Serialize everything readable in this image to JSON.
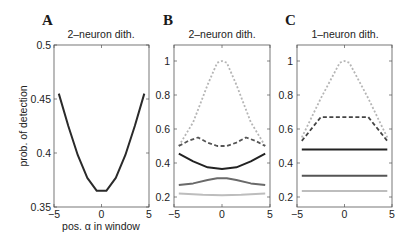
{
  "figure": {
    "panels": [
      {
        "letter": "A",
        "title": "2–neuron dith."
      },
      {
        "letter": "B",
        "title": "2–neuron dith."
      },
      {
        "letter": "C",
        "title": "1–neuron dith."
      }
    ],
    "a_ylabel": "prob. of detection",
    "a_xlabel": "pos. α in window",
    "a_yticks": [
      "0.5",
      "0.45",
      "0.4",
      "0.35"
    ],
    "bc_yticks": [
      "1",
      "0.8",
      "0.6",
      "0.4",
      "0.2"
    ],
    "xticks": [
      "−5",
      "0",
      "5"
    ]
  },
  "chart_data": [
    {
      "type": "line",
      "panel": "A",
      "title": "2–neuron dith.",
      "xlabel": "pos. α in window",
      "ylabel": "prob. of detection",
      "xlim": [
        -5,
        5
      ],
      "ylim": [
        0.35,
        0.5
      ],
      "xticks": [
        -5,
        0,
        5
      ],
      "yticks": [
        0.35,
        0.4,
        0.45,
        0.5
      ],
      "grid": false,
      "series": [
        {
          "name": "detection",
          "color": "#2a2a2a",
          "style": "solid",
          "x": [
            -4.5,
            -3.5,
            -2.5,
            -1.5,
            -0.5,
            0.5,
            1.5,
            2.5,
            3.5,
            4.5
          ],
          "y": [
            0.455,
            0.425,
            0.398,
            0.377,
            0.365,
            0.365,
            0.377,
            0.398,
            0.425,
            0.455
          ]
        }
      ]
    },
    {
      "type": "line",
      "panel": "B",
      "title": "2–neuron dith.",
      "xlabel": "",
      "ylabel": "",
      "xlim": [
        -5,
        5
      ],
      "ylim": [
        0.15,
        1.1
      ],
      "xticks": [
        -5,
        0,
        5
      ],
      "yticks": [
        0.2,
        0.4,
        0.6,
        0.8,
        1.0
      ],
      "grid": false,
      "series": [
        {
          "name": "light dotted",
          "color": "#b5b5b5",
          "style": "dotted",
          "x": [
            -4.5,
            -3,
            -1.5,
            -0.5,
            0,
            0.5,
            1.5,
            3,
            4.5
          ],
          "y": [
            0.5,
            0.64,
            0.86,
            0.99,
            1.0,
            0.99,
            0.86,
            0.64,
            0.5
          ]
        },
        {
          "name": "dark dashed",
          "color": "#555555",
          "style": "dashed",
          "x": [
            -4.5,
            -3.5,
            -2.5,
            -1.5,
            -0.5,
            0,
            0.5,
            1.5,
            2.5,
            3.5,
            4.5
          ],
          "y": [
            0.5,
            0.53,
            0.55,
            0.52,
            0.5,
            0.5,
            0.5,
            0.52,
            0.55,
            0.53,
            0.5
          ]
        },
        {
          "name": "black solid",
          "color": "#222222",
          "style": "solid",
          "x": [
            -4.5,
            -3,
            -1.5,
            0,
            1.5,
            3,
            4.5
          ],
          "y": [
            0.455,
            0.41,
            0.375,
            0.365,
            0.375,
            0.41,
            0.455
          ]
        },
        {
          "name": "gray solid",
          "color": "#6a6a6a",
          "style": "solid",
          "x": [
            -4.5,
            -3,
            -1.5,
            -0.5,
            0,
            0.5,
            1.5,
            3,
            4.5
          ],
          "y": [
            0.27,
            0.28,
            0.3,
            0.31,
            0.31,
            0.31,
            0.3,
            0.28,
            0.27
          ]
        },
        {
          "name": "light solid",
          "color": "#bdbdbd",
          "style": "solid",
          "x": [
            -4.5,
            -2,
            0,
            2,
            4.5
          ],
          "y": [
            0.22,
            0.213,
            0.21,
            0.213,
            0.22
          ]
        }
      ]
    },
    {
      "type": "line",
      "panel": "C",
      "title": "1–neuron dith.",
      "xlabel": "",
      "ylabel": "",
      "xlim": [
        -5,
        5
      ],
      "ylim": [
        0.15,
        1.1
      ],
      "xticks": [
        -5,
        0,
        5
      ],
      "yticks": [
        0.2,
        0.4,
        0.6,
        0.8,
        1.0
      ],
      "grid": false,
      "series": [
        {
          "name": "light dotted",
          "color": "#b5b5b5",
          "style": "dotted",
          "x": [
            -4.5,
            -2.5,
            -0.5,
            0,
            0.5,
            2.5,
            4.5
          ],
          "y": [
            0.55,
            0.78,
            0.99,
            1.0,
            0.99,
            0.78,
            0.55
          ]
        },
        {
          "name": "dark dashed",
          "color": "#444444",
          "style": "dashed",
          "x": [
            -4.5,
            -2.5,
            2.5,
            4.5
          ],
          "y": [
            0.53,
            0.67,
            0.67,
            0.53
          ]
        },
        {
          "name": "black solid",
          "color": "#222222",
          "style": "solid",
          "x": [
            -4.5,
            4.5
          ],
          "y": [
            0.48,
            0.48
          ]
        },
        {
          "name": "gray solid",
          "color": "#555555",
          "style": "solid",
          "x": [
            -4.5,
            4.5
          ],
          "y": [
            0.325,
            0.325
          ]
        },
        {
          "name": "light solid",
          "color": "#bdbdbd",
          "style": "solid",
          "x": [
            -4.5,
            4.5
          ],
          "y": [
            0.235,
            0.235
          ]
        }
      ]
    }
  ]
}
